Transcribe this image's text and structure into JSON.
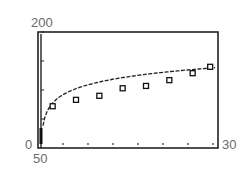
{
  "chart_data": {
    "type": "scatter",
    "title": "",
    "xlabel": "",
    "ylabel": "",
    "tick_labels": {
      "ymax": "200",
      "ymin": "0",
      "x_left": "50",
      "x_right": "30"
    },
    "xlim": [
      0,
      30
    ],
    "ylim": [
      0,
      200
    ],
    "grid": false,
    "legend": null,
    "x_tick_count": 7,
    "series": [
      {
        "name": "data",
        "marker": "square",
        "points": [
          {
            "x": 2,
            "y": 72
          },
          {
            "x": 6,
            "y": 83
          },
          {
            "x": 10,
            "y": 90
          },
          {
            "x": 14,
            "y": 103
          },
          {
            "x": 18,
            "y": 107
          },
          {
            "x": 22,
            "y": 117
          },
          {
            "x": 26,
            "y": 129
          },
          {
            "x": 29,
            "y": 140
          }
        ]
      },
      {
        "name": "fit",
        "style": "line",
        "description": "logarithmic-shaped fit curve rising steeply near x=0 then flattening"
      }
    ]
  },
  "colors": {
    "frame": "#222222",
    "curve": "#222222",
    "label": "#6a6a6a"
  }
}
